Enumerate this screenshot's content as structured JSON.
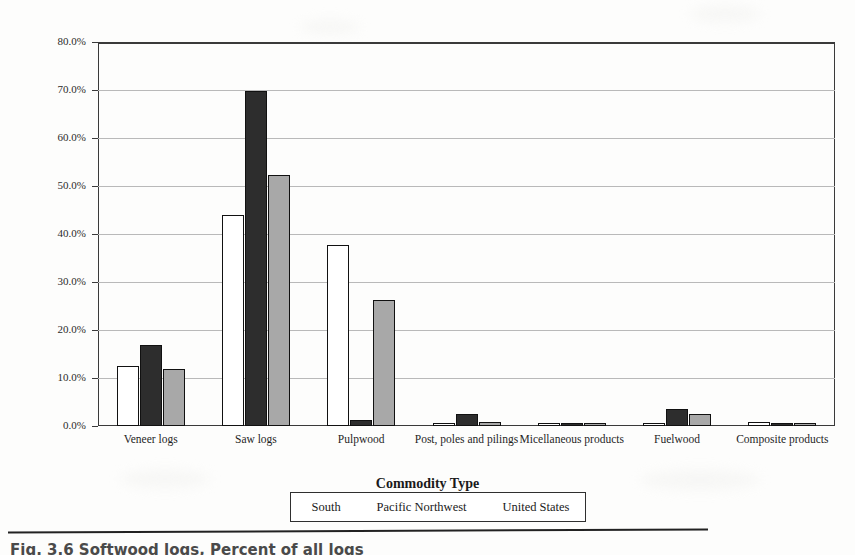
{
  "figure": {
    "caption_partial": "Fig. 3.6  Softwood logs, Percent of all logs",
    "axis_x_title": "Commodity Type",
    "axis_y_title": "Percent of All Logs"
  },
  "legend": {
    "entries": [
      {
        "label": "South",
        "swatch": "white-bar-swatch",
        "color": "#ffffff"
      },
      {
        "label": "Pacific Northwest",
        "swatch": "black-bar-swatch",
        "color": "#2d2d2d"
      },
      {
        "label": "United States",
        "swatch": "gray-bar-swatch",
        "color": "#a8a8a8"
      }
    ]
  },
  "chart_data": {
    "type": "bar",
    "title": "",
    "xlabel": "Commodity Type",
    "ylabel": "Percent of All Logs",
    "ylim": [
      0,
      80
    ],
    "ytick_labels": [
      "0.0%",
      "10.0%",
      "20.0%",
      "30.0%",
      "40.0%",
      "50.0%",
      "60.0%",
      "70.0%",
      "80.0%"
    ],
    "ytick_values": [
      0,
      10,
      20,
      30,
      40,
      50,
      60,
      70,
      80
    ],
    "grid": true,
    "legend_position": "below-axis-title",
    "categories": [
      "Veneer logs",
      "Saw logs",
      "Pulpwood",
      "Post, poles and pilings",
      "Micellaneous products",
      "Fuelwood",
      "Composite products"
    ],
    "series": [
      {
        "name": "South",
        "color": "#ffffff",
        "values": [
          12.5,
          44.0,
          37.8,
          0.4,
          0.0,
          0.3,
          0.8
        ]
      },
      {
        "name": "Pacific Northwest",
        "color": "#2d2d2d",
        "values": [
          16.8,
          69.7,
          1.2,
          2.6,
          0.5,
          3.6,
          0.0
        ]
      },
      {
        "name": "United States",
        "color": "#a8a8a8",
        "values": [
          11.9,
          52.3,
          26.2,
          0.9,
          0.6,
          2.4,
          0.7
        ]
      }
    ]
  }
}
